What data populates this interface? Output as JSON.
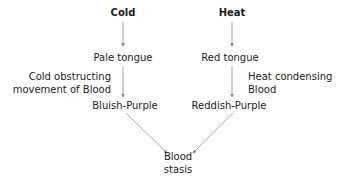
{
  "diagram": {
    "left": {
      "cause": "Cold",
      "stage1": "Pale tongue",
      "mechanism_line1": "Cold obstructing",
      "mechanism_line2": "movement of Blood",
      "stage2": "Bluish-Purple"
    },
    "right": {
      "cause": "Heat",
      "stage1": "Red tongue",
      "mechanism_line1": "Heat condensing",
      "mechanism_line2": "Blood",
      "stage2": "Reddish-Purple"
    },
    "result_line1": "Blood",
    "result_line2": "stasis",
    "colors": {
      "text": "#1a1a1a",
      "arrow": "#8a8a8a"
    }
  }
}
